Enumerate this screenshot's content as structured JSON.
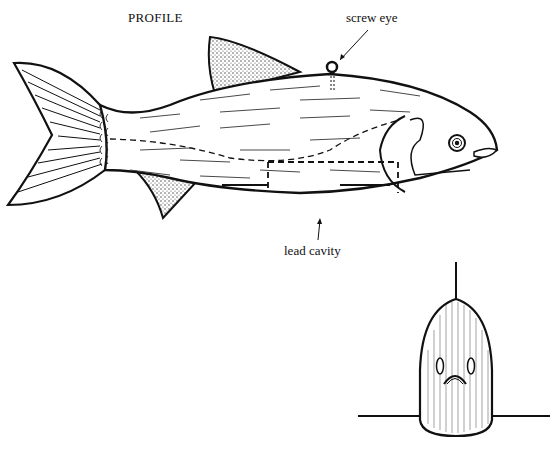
{
  "diagram": {
    "title": "PROFILE",
    "annotations": {
      "screw_eye": "screw eye",
      "lead_cavity": "lead cavity"
    },
    "views": [
      "profile",
      "front"
    ],
    "colors": {
      "ink": "#111111",
      "background": "#ffffff",
      "stipple": "#444444"
    }
  }
}
